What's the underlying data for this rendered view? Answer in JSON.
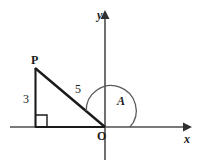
{
  "figure": {
    "kind": "geometry-diagram",
    "title_text": "",
    "background_color": "#ffffff",
    "stroke_color": "#1a1a1a",
    "axis_color": "#555555",
    "labels": {
      "y_axis": "y",
      "x_axis": "x",
      "origin": "O",
      "vertex_p": "P",
      "opposite_side": "3",
      "hypotenuse": "5",
      "angle": "A"
    },
    "icons": {
      "y_axis_arrow": "arrow-up-icon",
      "x_axis_arrow": "arrow-right-icon",
      "right_angle": "right-angle-marker-icon",
      "angle_arc": "angle-arc-icon"
    },
    "geometry": {
      "origin": {
        "x": 105,
        "y": 127
      },
      "vertex_p": {
        "x": 35,
        "y": 68
      },
      "foot": {
        "x": 35,
        "y": 127
      },
      "vertical_leg_length": "3",
      "hypotenuse_length": "5",
      "angle_name": "A"
    }
  }
}
